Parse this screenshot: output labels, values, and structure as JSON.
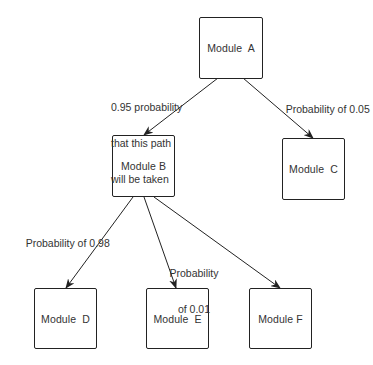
{
  "diagram": {
    "type": "module-call-probability-tree",
    "nodes": [
      {
        "id": "A",
        "label": "Module  A",
        "x": 199,
        "y": 17,
        "w": 64,
        "h": 62
      },
      {
        "id": "B",
        "label": "Module B",
        "x": 112,
        "y": 135,
        "w": 63,
        "h": 62
      },
      {
        "id": "C",
        "label": "Module  C",
        "x": 282,
        "y": 138,
        "w": 63,
        "h": 62
      },
      {
        "id": "D",
        "label": "Module  D",
        "x": 34,
        "y": 288,
        "w": 63,
        "h": 61
      },
      {
        "id": "E",
        "label": "Module  E",
        "x": 146,
        "y": 288,
        "w": 63,
        "h": 61
      },
      {
        "id": "F",
        "label": "Module F",
        "x": 249,
        "y": 288,
        "w": 63,
        "h": 61
      }
    ],
    "edges": [
      {
        "from": "A",
        "to": "B",
        "label": "0.95 probability\nthat this path\nwill be taken",
        "probability": 0.95
      },
      {
        "from": "A",
        "to": "C",
        "label": "Probability of 0.05",
        "probability": 0.05
      },
      {
        "from": "B",
        "to": "D",
        "label": "Probability of 0.98",
        "probability": 0.98
      },
      {
        "from": "B",
        "to": "E",
        "label": "Probability\nof 0.01",
        "probability": 0.01
      },
      {
        "from": "B",
        "to": "F",
        "label": "",
        "probability": null
      }
    ]
  },
  "labels": {
    "a_to_b": {
      "line1": "0.95 probability",
      "line2": "that this path",
      "line3": "will be taken"
    },
    "a_to_c": "Probability of 0.05",
    "b_to_d": "Probability of 0.98",
    "b_to_e": {
      "line1": "Probability",
      "line2": "of 0.01"
    }
  },
  "colors": {
    "line": "#222222",
    "text": "#333333",
    "background": "#ffffff"
  }
}
